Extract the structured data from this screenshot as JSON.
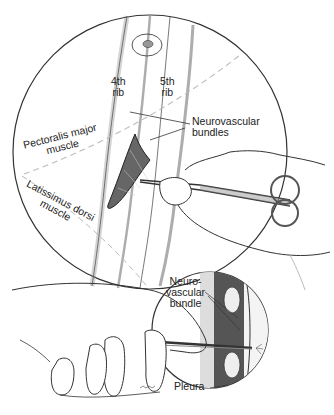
{
  "figure": {
    "type": "surgical-illustration",
    "colors": {
      "line": "#333333",
      "shade": "#555555",
      "light_line": "#999999",
      "dashed": "#b0b0b0",
      "background": "#ffffff"
    }
  },
  "labels": {
    "rib4_line1": "4th",
    "rib4_line2": "rib",
    "rib5_line1": "5th",
    "rib5_line2": "rib",
    "nv_bundles_line1": "Neurovascular",
    "nv_bundles_line2": "bundles",
    "pectoralis_line1": "Pectoralis major",
    "pectoralis_line2": "muscle",
    "latissimus_line1": "Latissimus dorsi",
    "latissimus_line2": "muscle",
    "nv_bundle_line1": "Neuro-",
    "nv_bundle_line2": "vascular",
    "nv_bundle_line3": "bundle",
    "pleura": "Pleura"
  },
  "panels": [
    {
      "name": "top-circle-view",
      "description": "Incision between 4th and 5th ribs with clamp spreading tissue"
    },
    {
      "name": "bottom-inset-view",
      "description": "Cross-section showing finger guiding clamp over rib through pleura"
    }
  ]
}
